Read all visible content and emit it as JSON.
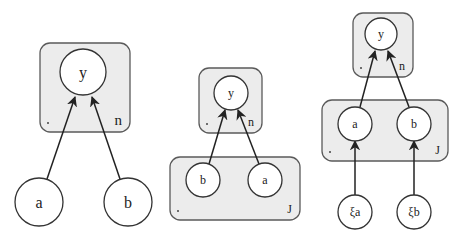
{
  "diagram_1": {
    "plate": {
      "label": "n",
      "x": 40,
      "y": 43,
      "w": 90,
      "h": 89
    },
    "nodes": [
      {
        "id": "y",
        "label": "y",
        "cx": 83,
        "cy": 72,
        "r": 23,
        "fs": 16
      },
      {
        "id": "a",
        "label": "a",
        "cx": 39,
        "cy": 202,
        "r": 24,
        "fs": 16
      },
      {
        "id": "b",
        "label": "b",
        "cx": 128,
        "cy": 202,
        "r": 24,
        "fs": 16
      }
    ],
    "edges": [
      {
        "from": "a",
        "to": "y",
        "x1": 47,
        "y1": 179,
        "x2": 75,
        "y2": 97
      },
      {
        "from": "b",
        "to": "y",
        "x1": 120,
        "y1": 179,
        "x2": 92,
        "y2": 97
      }
    ]
  },
  "diagram_2": {
    "plate_n": {
      "label": "n",
      "x": 199,
      "y": 68,
      "w": 63,
      "h": 65
    },
    "plate_j": {
      "label": "J",
      "x": 170,
      "y": 157,
      "w": 130,
      "h": 63
    },
    "nodes": [
      {
        "id": "y",
        "label": "y",
        "cx": 231,
        "cy": 93,
        "r": 17,
        "fs": 12
      },
      {
        "id": "b",
        "label": "b",
        "cx": 203,
        "cy": 180,
        "r": 17,
        "fs": 12
      },
      {
        "id": "a",
        "label": "a",
        "cx": 265,
        "cy": 180,
        "r": 17,
        "fs": 12
      }
    ],
    "edges": [
      {
        "from": "b",
        "to": "y",
        "x1": 209,
        "y1": 164,
        "x2": 225,
        "y2": 110
      },
      {
        "from": "a",
        "to": "y",
        "x1": 259,
        "y1": 164,
        "x2": 238,
        "y2": 110
      }
    ]
  },
  "diagram_3": {
    "plate_n": {
      "label": "n",
      "x": 353,
      "y": 13,
      "w": 60,
      "h": 64
    },
    "plate_j": {
      "label": "J",
      "x": 322,
      "y": 100,
      "w": 126,
      "h": 61
    },
    "nodes": [
      {
        "id": "y",
        "label": "y",
        "cx": 381,
        "cy": 34,
        "r": 16,
        "fs": 12
      },
      {
        "id": "a",
        "label": "a",
        "cx": 355,
        "cy": 124,
        "r": 17,
        "fs": 12
      },
      {
        "id": "b",
        "label": "b",
        "cx": 414,
        "cy": 124,
        "r": 17,
        "fs": 12
      },
      {
        "id": "xi_a",
        "label": "ξa",
        "cx": 355,
        "cy": 212,
        "r": 17,
        "fs": 12
      },
      {
        "id": "xi_b",
        "label": "ξb",
        "cx": 414,
        "cy": 212,
        "r": 17,
        "fs": 12
      }
    ],
    "edges": [
      {
        "from": "a",
        "to": "y",
        "x1": 360,
        "y1": 107,
        "x2": 375,
        "y2": 51
      },
      {
        "from": "b",
        "to": "y",
        "x1": 409,
        "y1": 107,
        "x2": 388,
        "y2": 51
      },
      {
        "from": "xi_a",
        "to": "a",
        "x1": 355,
        "y1": 195,
        "x2": 355,
        "y2": 141
      },
      {
        "from": "xi_b",
        "to": "b",
        "x1": 414,
        "y1": 195,
        "x2": 414,
        "y2": 141
      }
    ]
  }
}
